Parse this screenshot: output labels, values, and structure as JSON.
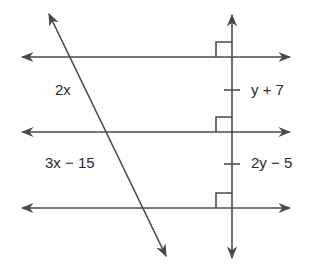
{
  "diagram": {
    "stroke_color": "#4a4a4a",
    "labels": {
      "top_segment_left": "2x",
      "bottom_segment_left": "3x − 15",
      "top_segment_right": "y + 7",
      "bottom_segment_right": "2y − 5"
    },
    "markers": {
      "right_angles": 3,
      "congruence_ticks": 2
    }
  }
}
